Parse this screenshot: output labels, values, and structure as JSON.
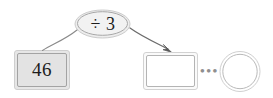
{
  "diagram": {
    "type": "function-machine-flow",
    "start_node": {
      "shape": "rectangle",
      "value": "46",
      "fill": "#e3e3e3",
      "border": "#9a9a9a"
    },
    "operation_node": {
      "shape": "ellipse",
      "label": "÷ 3",
      "fill": "#ededed",
      "border": "#9a9a9a"
    },
    "result_node": {
      "shape": "rectangle",
      "value": "",
      "fill": "#ffffff",
      "border": "#b4b4b4"
    },
    "continuation": {
      "label": "•••",
      "color": "#8f8f8f"
    },
    "final_node": {
      "shape": "circle",
      "value": "",
      "fill": "#ffffff",
      "border": "#b9b9b9"
    },
    "arrows": [
      {
        "name": "input-arrow",
        "from": "operation_node",
        "to": "start_node",
        "has_arrowhead": false,
        "color": "#7d7d7d"
      },
      {
        "name": "output-arrow",
        "from": "operation_node",
        "to": "result_node",
        "has_arrowhead": true,
        "color": "#5a5a5a"
      }
    ]
  }
}
